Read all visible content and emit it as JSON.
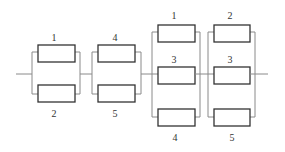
{
  "diagram": {
    "type": "reliability-block-diagram",
    "colors": {
      "wire": "#8a8a8a",
      "box": "#333333",
      "label": "#333333",
      "background": "#ffffff"
    },
    "stages": [
      {
        "id": "stage-1",
        "blocks": [
          {
            "label": "1"
          },
          {
            "label": "2"
          }
        ]
      },
      {
        "id": "stage-2",
        "blocks": [
          {
            "label": "4"
          },
          {
            "label": "5"
          }
        ]
      },
      {
        "id": "stage-3",
        "blocks": [
          {
            "label": "1"
          },
          {
            "label": "3"
          },
          {
            "label": "4"
          }
        ]
      },
      {
        "id": "stage-4",
        "blocks": [
          {
            "label": "2"
          },
          {
            "label": "3"
          },
          {
            "label": "5"
          }
        ]
      }
    ]
  }
}
